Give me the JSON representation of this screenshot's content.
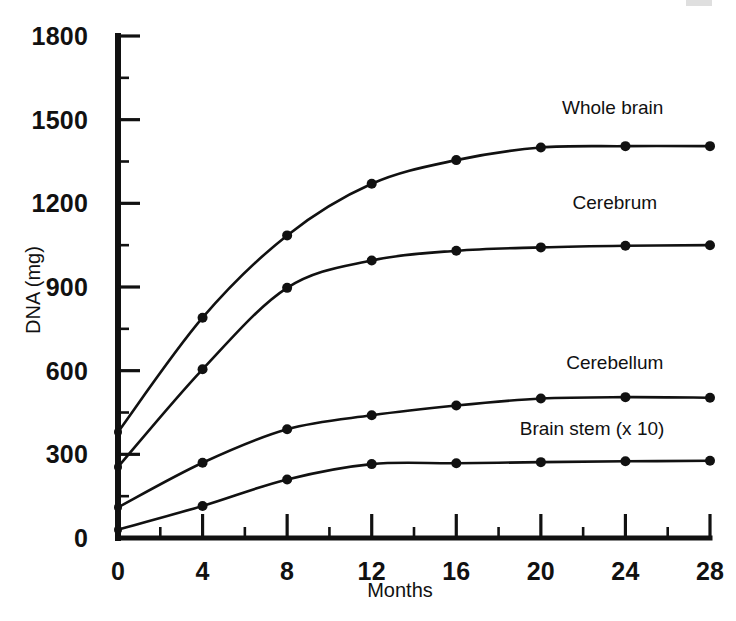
{
  "figure": {
    "background_color": "#ffffff",
    "ink_color": "#111111"
  },
  "chart_data": {
    "type": "line",
    "title": "",
    "xlabel": "Months",
    "ylabel": "DNA (mg)",
    "xlim": [
      0,
      28
    ],
    "ylim": [
      0,
      1800
    ],
    "x": [
      0,
      4,
      8,
      12,
      16,
      20,
      24,
      28
    ],
    "xticks": [
      0,
      4,
      8,
      12,
      16,
      20,
      24,
      28
    ],
    "xtick_labels": [
      "0",
      "4",
      "8",
      "12",
      "16",
      "20",
      "24",
      "28"
    ],
    "x_minor_ticks": [
      2,
      6,
      10,
      14,
      18,
      22,
      26
    ],
    "yticks": [
      0,
      300,
      600,
      900,
      1200,
      1500,
      1800
    ],
    "ytick_labels": [
      "0",
      "300",
      "600",
      "900",
      "1200",
      "1500",
      "1800"
    ],
    "y_minor_ticks": [
      150,
      450,
      750,
      1050,
      1350,
      1650
    ],
    "grid": false,
    "legend": "inline-curve-labels",
    "marker": "filled-circle",
    "series": [
      {
        "name": "Whole brain",
        "label": "Whole brain",
        "values": [
          380,
          790,
          1085,
          1270,
          1355,
          1400,
          1405,
          1405
        ],
        "label_x": 21.0,
        "label_y": 1520
      },
      {
        "name": "Cerebrum",
        "label": "Cerebrum",
        "values": [
          255,
          605,
          897,
          995,
          1030,
          1042,
          1048,
          1050
        ],
        "label_x": 21.5,
        "label_y": 1178
      },
      {
        "name": "Cerebellum",
        "label": "Cerebellum",
        "values": [
          110,
          270,
          390,
          440,
          475,
          500,
          505,
          503
        ],
        "label_x": 21.2,
        "label_y": 605
      },
      {
        "name": "Brain stem (x 10)",
        "label": "Brain stem (x 10)",
        "values": [
          30,
          115,
          210,
          265,
          268,
          272,
          275,
          277
        ],
        "label_x": 19.0,
        "label_y": 368
      }
    ]
  }
}
